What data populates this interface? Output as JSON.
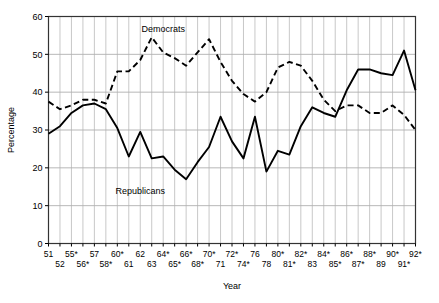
{
  "chart_data": {
    "type": "line",
    "title": "",
    "xlabel": "Year",
    "ylabel": "Percentage",
    "ylim": [
      0,
      60
    ],
    "yticks": [
      0,
      10,
      20,
      30,
      40,
      50,
      60
    ],
    "grid": true,
    "legend_position": "inline-annotations",
    "annotations": [
      {
        "text": "Democrats",
        "x_year": "64*",
        "y_value": 56
      },
      {
        "text": "Republicans",
        "x_year": "62",
        "y_value": 13
      }
    ],
    "categories": [
      "51",
      "52",
      "55*",
      "56*",
      "57",
      "58*",
      "60*",
      "61",
      "62",
      "63",
      "64*",
      "65*",
      "66*",
      "68*",
      "70*",
      "71",
      "72*",
      "74*",
      "76",
      "78",
      "80*",
      "81*",
      "82*",
      "83",
      "84*",
      "85*",
      "86*",
      "87*",
      "88*",
      "89",
      "90*",
      "91*",
      "92*"
    ],
    "x_tick_rows": {
      "description": "Tick labels are staggered on two rows; row 1 holds the odd-indexed ticks, row 2 the even-indexed ticks.",
      "row1": [
        "51",
        "55*",
        "57",
        "60*",
        "62",
        "64*",
        "66*",
        "70*",
        "72*",
        "76",
        "80*",
        "82*",
        "84*",
        "86*",
        "88*",
        "90*",
        "92*"
      ],
      "row2": [
        "52",
        "56*",
        "58*",
        "61",
        "63",
        "65*",
        "68*",
        "71",
        "74*",
        "78",
        "81*",
        "83",
        "85*",
        "87*",
        "89",
        "91*"
      ]
    },
    "series": [
      {
        "name": "Democrats",
        "style": "dashed",
        "color": "#000000",
        "values": [
          37.5,
          35.5,
          36.5,
          38.0,
          38.0,
          37.0,
          45.5,
          45.5,
          48.5,
          54.5,
          50.5,
          49.0,
          47.0,
          50.5,
          54.0,
          48.0,
          43.0,
          39.5,
          37.5,
          40.0,
          46.5,
          48.0,
          47.0,
          43.0,
          38.0,
          35.0,
          36.5,
          36.5,
          34.5,
          34.5,
          36.5,
          34.0,
          30.0
        ]
      },
      {
        "name": "Republicans",
        "style": "solid",
        "color": "#000000",
        "values": [
          29.0,
          31.0,
          34.5,
          36.5,
          37.0,
          35.5,
          30.5,
          23.0,
          29.5,
          22.5,
          23.0,
          19.5,
          17.0,
          21.5,
          25.5,
          33.5,
          27.0,
          22.5,
          33.5,
          19.0,
          24.5,
          23.5,
          31.0,
          36.0,
          34.5,
          33.5,
          40.5,
          46.0,
          46.0,
          45.0,
          44.5,
          51.0,
          40.5
        ]
      }
    ],
    "series_last_tail": {
      "note": "Both series extend to the final tick; solid ends near 44 and dashed near 40.",
      "republicans_final": 44.0,
      "democrats_final": 40.5
    }
  },
  "axis": {
    "y_title": "Percentage",
    "x_title": "Year"
  }
}
